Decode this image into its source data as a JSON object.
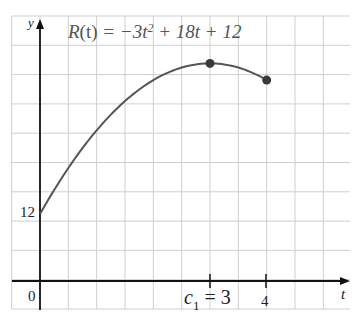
{
  "chart_data": {
    "type": "line",
    "function": {
      "name": "R(t)",
      "expression": "-3t^2 + 18t + 12",
      "domain": [
        0,
        4
      ]
    },
    "x": [
      0,
      0.5,
      1,
      1.5,
      2,
      2.5,
      3,
      3.5,
      4
    ],
    "series": [
      {
        "name": "R(t)",
        "values": [
          12,
          20.25,
          27,
          32.25,
          36,
          38.25,
          39,
          38.25,
          36
        ]
      }
    ],
    "points": [
      {
        "label": "maximum",
        "t": 3,
        "value": 39
      },
      {
        "label": "endpoint",
        "t": 4,
        "value": 36
      }
    ],
    "xlabel": "t",
    "ylabel": "y",
    "x_ticks": [
      {
        "value": 0,
        "label": "0"
      },
      {
        "value": 3,
        "label": "c1 = 3"
      },
      {
        "value": 4,
        "label": "4"
      }
    ],
    "y_ticks": [
      {
        "value": 12,
        "label": "12"
      }
    ],
    "xlim": [
      -0.5,
      5.5
    ],
    "ylim": [
      -5,
      47
    ],
    "grid": true,
    "legend": "none"
  },
  "labels": {
    "func_name": "R",
    "func_var": "(t)",
    "func_eq": " = −3t",
    "func_exp": "2",
    "func_rest": " + 18t + 12",
    "y_axis": "y",
    "t_axis": "t",
    "origin": "0",
    "y_tick_12": "12",
    "c_letter": "c",
    "c_sub": "1",
    "c_value": " = 3",
    "x_tick_4": "4"
  },
  "colors": {
    "curve": "#555555",
    "point": "#3a3a3a",
    "axis": "#111111",
    "grid": "#cfcfcf"
  }
}
